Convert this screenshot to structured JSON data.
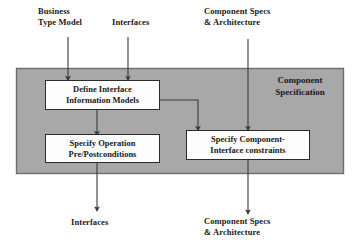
{
  "diagram": {
    "colors": {
      "container_fill": "#a8a8a8",
      "container_border": "#6d6d6d",
      "box_fill": "#fdfdfd",
      "box_border": "#2b2b2b",
      "arrow": "#3a3a3a",
      "text": "#1a1a1a",
      "background": "#ffffff"
    },
    "container": {
      "label": "Component\nSpecification"
    },
    "inputs": [
      {
        "id": "business-type-model",
        "label": "Business\nType Model"
      },
      {
        "id": "interfaces-in",
        "label": "Interfaces"
      },
      {
        "id": "component-specs-architecture-in",
        "label": "Component Specs\n& Architecture"
      }
    ],
    "processes": [
      {
        "id": "define-interface-information-models",
        "label": "Define Interface\nInformation Models"
      },
      {
        "id": "specify-operation-pre-postconditions",
        "label": "Specify Operation\nPre/Postconditions"
      },
      {
        "id": "specify-component-interface-constraints",
        "label": "Specify Component-\nInterface constraints"
      }
    ],
    "outputs": [
      {
        "id": "interfaces-out",
        "label": "Interfaces"
      },
      {
        "id": "component-specs-architecture-out",
        "label": "Component Specs\n& Architecture"
      }
    ]
  }
}
